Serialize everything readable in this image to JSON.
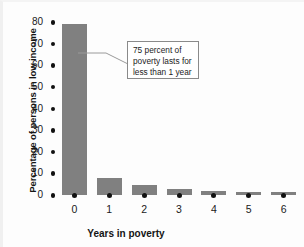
{
  "chart_data": {
    "type": "bar",
    "title": "",
    "subtitle": "",
    "xlabel": "Years in poverty",
    "ylabel": "Percentage of persons in low income",
    "categories": [
      "0",
      "1",
      "2",
      "3",
      "4",
      "5",
      "6"
    ],
    "values": [
      79,
      8,
      4.5,
      3,
      2,
      1.5,
      1.5
    ],
    "ylim": [
      0,
      80
    ],
    "ytick_labels": [
      "0",
      "10",
      "20",
      "30",
      "40",
      "50",
      "60",
      "70",
      "80"
    ],
    "ytick_values": [
      0,
      10,
      20,
      30,
      40,
      50,
      60,
      70,
      80
    ],
    "xtick_labels": [
      "0",
      "1",
      "2",
      "3",
      "4",
      "5",
      "6"
    ],
    "grid": false,
    "legend": "none",
    "bar_color": "#808080",
    "axis_color": "#111111",
    "annotations": [
      {
        "name": "poverty-duration-callout",
        "lines": [
          "75 percent of",
          "poverty lasts for",
          "less than 1 year"
        ],
        "target_category": "0"
      }
    ]
  },
  "annotation": {
    "line1": "75 percent of",
    "line2": "poverty lasts for",
    "line3": "less than 1 year"
  },
  "axes": {
    "x_title": "Years in poverty",
    "y_title": "Percentage of persons in low income"
  }
}
